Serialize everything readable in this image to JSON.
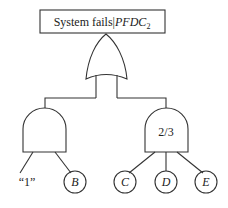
{
  "diagram": {
    "type": "fault-tree",
    "top_event": {
      "label_main": "System fails|",
      "label_italic": "PFDC",
      "label_sub": "2"
    },
    "gates": [
      {
        "id": "or-gate",
        "type": "OR"
      },
      {
        "id": "and-gate-left",
        "type": "AND",
        "label": ""
      },
      {
        "id": "vote-gate-right",
        "type": "AND",
        "label": "2/3"
      }
    ],
    "basic_events": {
      "one": "“1”",
      "b": "B",
      "c": "C",
      "d": "D",
      "e": "E"
    },
    "colors": {
      "line": "#333333",
      "background": "#ffffff"
    }
  }
}
